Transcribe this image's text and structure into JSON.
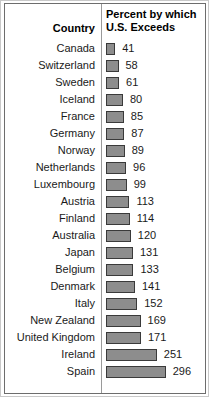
{
  "header": {
    "country_label": "Country",
    "percent_line1": "Percent by which",
    "percent_line2": "U.S. Exceeds"
  },
  "style": {
    "bar_fill": "#8d8d8d",
    "bar_border": "#3a3a3a",
    "bar_shadow": "#9e9e9e",
    "frame_border": "#6d6d6d",
    "background": "#ffffff",
    "text": "#1a1a1a"
  },
  "chart_data": {
    "type": "bar",
    "orientation": "horizontal",
    "title": "",
    "xlabel": "Percent by which U.S. Exceeds",
    "ylabel": "Country",
    "grid": false,
    "legend": false,
    "xlim": [
      0,
      300
    ],
    "categories": [
      "Canada",
      "Switzerland",
      "Sweden",
      "Iceland",
      "France",
      "Germany",
      "Norway",
      "Netherlands",
      "Luxembourg",
      "Austria",
      "Finland",
      "Australia",
      "Japan",
      "Belgium",
      "Denmark",
      "Italy",
      "New Zealand",
      "United Kingdom",
      "Ireland",
      "Spain"
    ],
    "values": [
      41,
      58,
      61,
      80,
      85,
      87,
      89,
      96,
      99,
      113,
      114,
      120,
      131,
      133,
      141,
      152,
      169,
      171,
      251,
      296
    ],
    "rows": [
      {
        "country": "Canada",
        "value": 41
      },
      {
        "country": "Switzerland",
        "value": 58
      },
      {
        "country": "Sweden",
        "value": 61
      },
      {
        "country": "Iceland",
        "value": 80
      },
      {
        "country": "France",
        "value": 85
      },
      {
        "country": "Germany",
        "value": 87
      },
      {
        "country": "Norway",
        "value": 89
      },
      {
        "country": "Netherlands",
        "value": 96
      },
      {
        "country": "Luxembourg",
        "value": 99
      },
      {
        "country": "Austria",
        "value": 113
      },
      {
        "country": "Finland",
        "value": 114
      },
      {
        "country": "Australia",
        "value": 120
      },
      {
        "country": "Japan",
        "value": 131
      },
      {
        "country": "Belgium",
        "value": 133
      },
      {
        "country": "Denmark",
        "value": 141
      },
      {
        "country": "Italy",
        "value": 152
      },
      {
        "country": "New Zealand",
        "value": 169
      },
      {
        "country": "United Kingdom",
        "value": 171
      },
      {
        "country": "Ireland",
        "value": 251
      },
      {
        "country": "Spain",
        "value": 296
      }
    ]
  }
}
